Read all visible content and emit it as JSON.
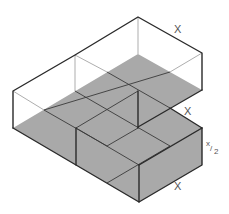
{
  "diagram": {
    "type": "isometric L-shaped box with shaded floor grid",
    "labels": {
      "top_edge": "X",
      "notch_edge": "X",
      "height": "x/2",
      "height_num": "x",
      "height_den": "2",
      "bottom_edge": "X"
    },
    "colors": {
      "floor": "#a9a9a9",
      "edge": "#2a2a2a",
      "hidden_edge": "#8a8a8a",
      "label": "#555555"
    }
  }
}
